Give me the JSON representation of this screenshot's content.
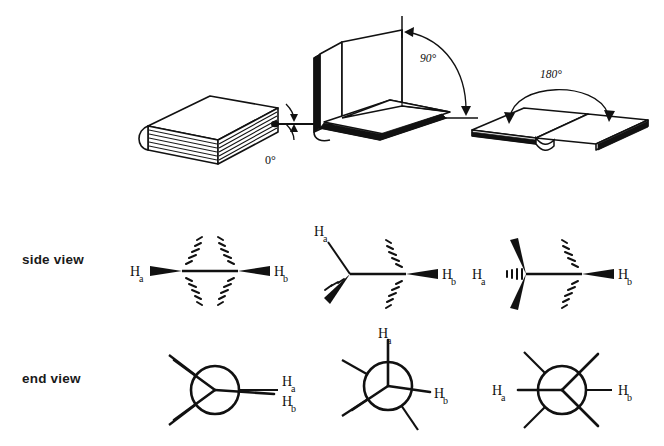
{
  "figure": {
    "background": "#ffffff",
    "ink": "#111111"
  },
  "rows": {
    "side_view_label": "side view",
    "end_view_label": "end view"
  },
  "columns": [
    {
      "id": "eclipsed",
      "angle_label": "0°",
      "book_state": "closed",
      "ha": "H",
      "ha_sub": "a",
      "hb": "H",
      "hb_sub": "b",
      "side_view_description": "Both H atoms on bold wedges pointing outward, eclipsed",
      "end_view_description": "Newman projection with front and back bonds superimposed, Ha over Hb"
    },
    {
      "id": "gauche",
      "angle_label": "90°",
      "book_state": "open at right angle",
      "ha": "H",
      "ha_sub": "a",
      "hb": "H",
      "hb_sub": "b",
      "side_view_description": "Ha on plain bond up-left, Hb on bold wedge right",
      "end_view_description": "Newman projection with Ha up and Hb right, bonds staggered"
    },
    {
      "id": "anti",
      "angle_label": "180°",
      "book_state": "open flat",
      "ha": "H",
      "ha_sub": "a",
      "hb": "H",
      "hb_sub": "b",
      "side_view_description": "Ha on hashed wedge left, Hb on bold wedge right, anti",
      "end_view_description": "Newman projection with Ha left and Hb right, opposed"
    }
  ]
}
